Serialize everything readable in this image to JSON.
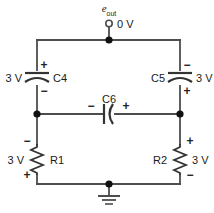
{
  "figure": {
    "type": "electrical-circuit-schematic",
    "background_color": "#ffffff",
    "line_color": "#4d4d4d",
    "text_color": "#1a1a1a",
    "width": 214,
    "height": 213
  },
  "output_terminal": {
    "symbol_label": "e",
    "symbol_subscript": "out",
    "voltage_label": "0 V",
    "terminal_style": "open-circle"
  },
  "components": {
    "c4": {
      "name": "C4",
      "voltage": "3 V",
      "type": "capacitor",
      "orientation": "vertical",
      "top_sign": "+",
      "bottom_sign": "−",
      "name_side": "right",
      "voltage_side": "left"
    },
    "c5": {
      "name": "C5",
      "voltage": "3 V",
      "type": "capacitor",
      "orientation": "vertical",
      "top_sign": "−",
      "bottom_sign": "+",
      "name_side": "left",
      "voltage_side": "right"
    },
    "c6": {
      "name": "C6",
      "voltage": "",
      "type": "capacitor",
      "orientation": "horizontal",
      "left_sign": "−",
      "right_sign": "+",
      "name_side": "top"
    },
    "r1": {
      "name": "R1",
      "voltage": "3 V",
      "type": "resistor",
      "orientation": "vertical",
      "top_sign": "−",
      "bottom_sign": "+",
      "name_side": "right",
      "voltage_side": "left"
    },
    "r2": {
      "name": "R2",
      "voltage": "3 V",
      "type": "resistor",
      "orientation": "vertical",
      "top_sign": "+",
      "bottom_sign": "−",
      "name_side": "left",
      "voltage_side": "right"
    }
  },
  "ground": {
    "label": "",
    "symbol": "earth-ground"
  },
  "nodes": [
    {
      "id": "top-node",
      "x": 109,
      "y": 40
    },
    {
      "id": "left-mid-node",
      "x": 37,
      "y": 114
    },
    {
      "id": "right-mid-node",
      "x": 180,
      "y": 114
    },
    {
      "id": "bottom-node",
      "x": 109,
      "y": 184
    }
  ]
}
